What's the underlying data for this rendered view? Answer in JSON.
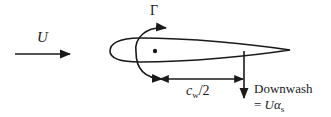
{
  "diagram": {
    "title": "",
    "labels": {
      "freestream": "U",
      "circulation": "Γ",
      "half_chord_main": "c",
      "half_chord_sub": "w",
      "half_chord_tail": "/2",
      "downwash_line1": "Downwash",
      "downwash_eq_prefix": "= ",
      "downwash_eq_U": "U",
      "downwash_eq_alpha": "α",
      "downwash_eq_sub": "s"
    },
    "elements": [
      {
        "id": "freestream-arrow",
        "type": "arrow",
        "direction": "right",
        "label": "U"
      },
      {
        "id": "airfoil",
        "type": "shape",
        "description": "Symmetric airfoil profile, leading edge left, trailing edge right"
      },
      {
        "id": "bound-vortex",
        "type": "point",
        "description": "Bound vortex location at quarter chord"
      },
      {
        "id": "circulation-arrow",
        "type": "curved-arrow",
        "direction": "clockwise",
        "label": "Γ"
      },
      {
        "id": "half-chord-dimension",
        "type": "dimension-line",
        "label": "c_w/2"
      },
      {
        "id": "downwash-arrow",
        "type": "arrow",
        "direction": "down",
        "label": "Downwash = Uα_s"
      }
    ],
    "colors": {
      "stroke": "#1a1a1a",
      "background": "#ffffff"
    }
  }
}
